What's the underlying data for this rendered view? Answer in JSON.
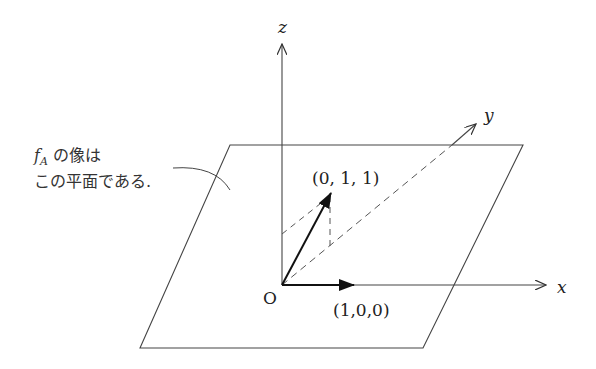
{
  "axes": {
    "x_label": "x",
    "y_label": "y",
    "z_label": "z",
    "origin_label": "O"
  },
  "vectors": [
    {
      "name": "e1",
      "label": "(1,0,0)"
    },
    {
      "name": "v",
      "label": "(0, 1, 1)"
    }
  ],
  "annotation": {
    "line1_math": "f",
    "line1_sub": "A",
    "line1_text": " の像は",
    "line2_text": "この平面である."
  },
  "colors": {
    "line": "#333333",
    "background": "#ffffff"
  }
}
